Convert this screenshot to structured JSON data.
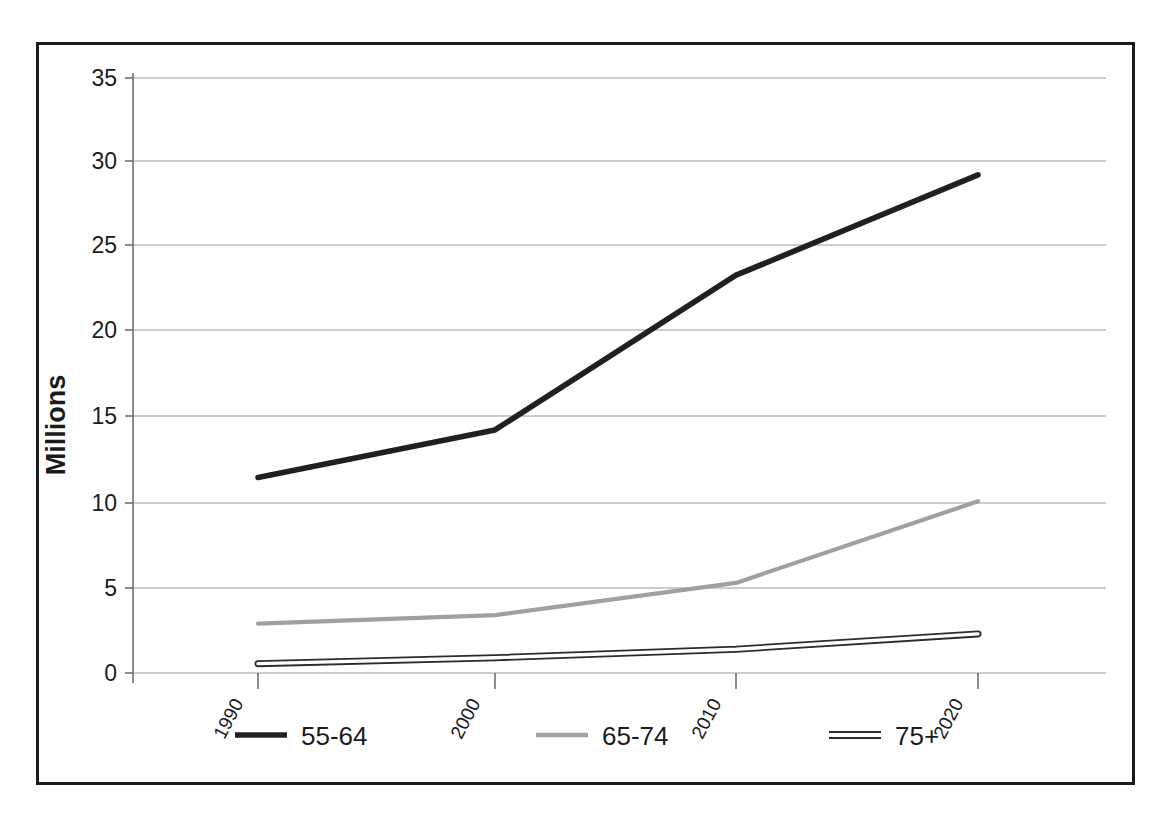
{
  "chart_data": {
    "type": "line",
    "title": "",
    "xlabel": "",
    "ylabel": "Millions",
    "x": [
      "1990",
      "2000",
      "2010",
      "2020"
    ],
    "categories": [
      "1990",
      "2000",
      "2010",
      "2020"
    ],
    "series": [
      {
        "name": "55-64",
        "values": [
          11.5,
          14.3,
          23.4,
          29.3
        ],
        "color": "#231f20",
        "style": "solid-thick"
      },
      {
        "name": "65-74",
        "values": [
          2.9,
          3.4,
          5.3,
          10.1
        ],
        "color": "#a0a0a0",
        "style": "solid-medium"
      },
      {
        "name": "75+",
        "values": [
          0.55,
          0.9,
          1.4,
          2.3
        ],
        "color": "#2b2b2b",
        "style": "outlined-ribbon"
      }
    ],
    "ylim": [
      0,
      35
    ],
    "yticks": [
      0,
      5,
      10,
      15,
      20,
      25,
      30,
      35
    ],
    "ytick_labels": [
      "0",
      "5",
      "10",
      "15",
      "20",
      "25",
      "30",
      "35"
    ],
    "grid": true,
    "grid_axis": "y",
    "legend_position": "bottom",
    "x_tick_label_rotation": -62
  },
  "axis": {
    "y_title": "Millions",
    "y_tick_labels": [
      "35",
      "30",
      "25",
      "20",
      "15",
      "10",
      "5",
      "0"
    ],
    "x_tick_labels": [
      "1990",
      "2000",
      "2010",
      "2020"
    ]
  },
  "legend": {
    "items": [
      {
        "label": "55-64",
        "swatch": "line-swatch-dark"
      },
      {
        "label": "65-74",
        "swatch": "line-swatch-gray"
      },
      {
        "label": "75+",
        "swatch": "line-swatch-outlined"
      }
    ]
  },
  "colors": {
    "series_55_64": "#231f20",
    "series_65_74": "#a0a0a0",
    "series_75_plus": "#2b2b2b",
    "grid": "#9a9a9a",
    "frame": "#1b1b1b",
    "text": "#1b1b1b"
  }
}
